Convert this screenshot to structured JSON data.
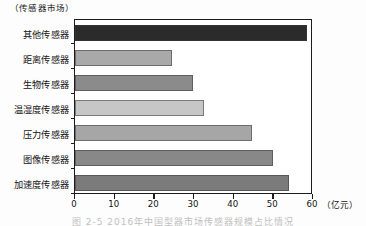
{
  "figure": {
    "unit_label": "（传感器市场）",
    "x_axis_unit": "（亿元）",
    "caption": "图 2-5  2016年中国型器市场传感器规模占比情况"
  },
  "chart_data": {
    "type": "bar",
    "orientation": "horizontal",
    "title": "（传感器市场）",
    "xlabel": "（亿元）",
    "ylabel": "",
    "xlim": [
      0,
      60
    ],
    "xticks": [
      0,
      10,
      20,
      30,
      40,
      50,
      60
    ],
    "xtick_labels": [
      "0",
      "10",
      "20",
      "30",
      "40",
      "50",
      "60"
    ],
    "grid": false,
    "legend": false,
    "categories": [
      "其他传感器",
      "距离传感器",
      "生物传感器",
      "温湿度传感器",
      "压力传感器",
      "图像传感器",
      "加速度传感器"
    ],
    "values": [
      58.5,
      24.5,
      29.8,
      32.5,
      44.5,
      50.0,
      54.0
    ],
    "bar_colors": [
      "#2b2b2b",
      "#a9a9a9",
      "#8b8b8b",
      "#c6c6c6",
      "#a6a6a6",
      "#888888",
      "#7b7b7b"
    ]
  }
}
